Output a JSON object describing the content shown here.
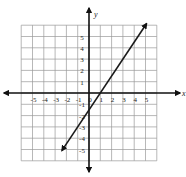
{
  "chart_data": {
    "type": "line",
    "title": "",
    "xlabel": "x",
    "ylabel": "y",
    "xlim": [
      -6,
      6
    ],
    "ylim": [
      -6,
      6
    ],
    "grid": true,
    "x_ticks": [
      -5,
      -4,
      -3,
      -2,
      -1,
      0,
      1,
      2,
      3,
      4,
      5
    ],
    "y_ticks": [
      -5,
      -4,
      -3,
      -2,
      -1,
      1,
      2,
      3,
      4,
      5
    ],
    "x_tick_labels": [
      "-5",
      "-4",
      "-3",
      "-2",
      "-1",
      "0",
      "1",
      "2",
      "3",
      "4",
      "5"
    ],
    "y_tick_labels": [
      "-5",
      "-4",
      "-3",
      "-2",
      "-1",
      "1",
      "2",
      "3",
      "4",
      "5"
    ],
    "series": [
      {
        "name": "line",
        "equation": "y = 1.5x - 1.5",
        "slope": 1.5,
        "y_intercept": -1.5,
        "x_intercept": 1,
        "x": [
          -2.4,
          5.1
        ],
        "y": [
          -5.1,
          6.15
        ],
        "arrows": "both-ends"
      }
    ],
    "legend": null
  },
  "colors": {
    "axis": "#111111",
    "grid": "#9a9a9a",
    "line": "#1a1a1a",
    "background": "#ffffff"
  }
}
